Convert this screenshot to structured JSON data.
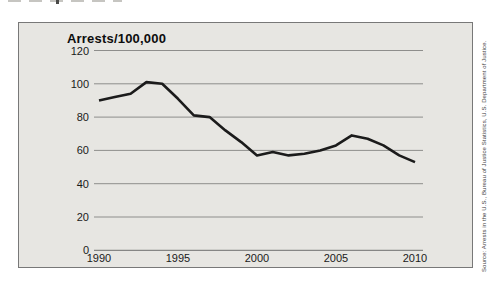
{
  "chart_data": {
    "type": "line",
    "title": "Arrests/100,000",
    "xlabel": "",
    "ylabel": "Arrests/100,000",
    "x": [
      1990,
      1991,
      1992,
      1993,
      1994,
      1995,
      1996,
      1997,
      1998,
      1999,
      2000,
      2001,
      2002,
      2003,
      2004,
      2005,
      2006,
      2007,
      2008,
      2009,
      2010
    ],
    "values": [
      90,
      92,
      94,
      101,
      100,
      91,
      81,
      80,
      72,
      65,
      57,
      59,
      57,
      58,
      60,
      63,
      69,
      67,
      63,
      57,
      53
    ],
    "xticks": [
      1990,
      1995,
      2000,
      2005,
      2010
    ],
    "yticks": [
      0,
      20,
      40,
      60,
      80,
      100,
      120
    ],
    "ylim": [
      0,
      120
    ],
    "grid": true,
    "legend_position": "none",
    "line_color": "#1b1b1b",
    "grid_color": "#8e8e8c",
    "axis_color": "#6f6f6f",
    "panel_background": "#e7e6e2",
    "source": "Source: Arrests in the U.S., Bureau of Justice Statistics, U.S. Department of Justice."
  }
}
